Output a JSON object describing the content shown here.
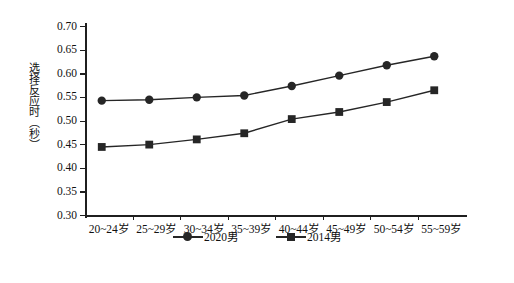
{
  "chart_data": {
    "type": "line",
    "title": "",
    "xlabel": "",
    "ylabel": "选择反应时（秒）",
    "ylim": [
      0.3,
      0.7
    ],
    "grid": false,
    "legend_position": "bottom-center",
    "categories": [
      "20~24岁",
      "25~29岁",
      "30~34岁",
      "35~39岁",
      "40~44岁",
      "45~49岁",
      "50~54岁",
      "55~59岁"
    ],
    "ytick_labels": [
      "0.70",
      "0.65",
      "0.60",
      "0.55",
      "0.50",
      "0.45",
      "0.40",
      "0.35",
      "0.30"
    ],
    "ytick_values": [
      0.7,
      0.65,
      0.6,
      0.55,
      0.5,
      0.45,
      0.4,
      0.35,
      0.3
    ],
    "series": [
      {
        "name": "2020男",
        "marker": "circle",
        "color": "#262626",
        "values": [
          0.542,
          0.544,
          0.549,
          0.553,
          0.573,
          0.595,
          0.617,
          0.636
        ]
      },
      {
        "name": "2014男",
        "marker": "square",
        "color": "#262626",
        "values": [
          0.444,
          0.449,
          0.46,
          0.473,
          0.503,
          0.518,
          0.539,
          0.564
        ]
      }
    ]
  },
  "legend": {
    "items": [
      {
        "label": "2020男",
        "marker": "circle"
      },
      {
        "label": "2014男",
        "marker": "square"
      }
    ]
  },
  "colors": {
    "axis": "#1f1f1f",
    "series": "#262626",
    "background": "#ffffff"
  }
}
